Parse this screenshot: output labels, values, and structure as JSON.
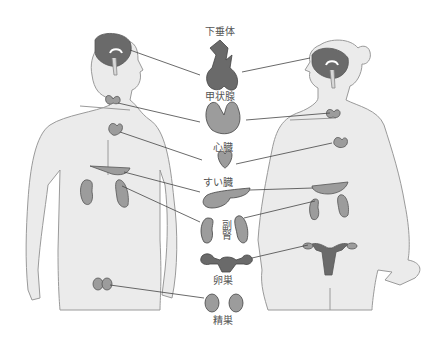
{
  "diagram": {
    "type": "endocrine-glands-male-female",
    "figures": [
      "male",
      "female"
    ],
    "labels": {
      "pituitary": "下垂体",
      "thyroid": "甲状腺",
      "heart": "心臓",
      "pancreas": "すい臓",
      "adrenal": "副腎",
      "ovary": "卵巣",
      "testis": "精巣"
    },
    "colors": {
      "body_fill": "#ebebeb",
      "body_stroke": "#9a9a9a",
      "organ_dark": "#6a6a6a",
      "organ_mid": "#9c9c9c",
      "leader_line": "#444444",
      "label_text": "#555555"
    }
  }
}
